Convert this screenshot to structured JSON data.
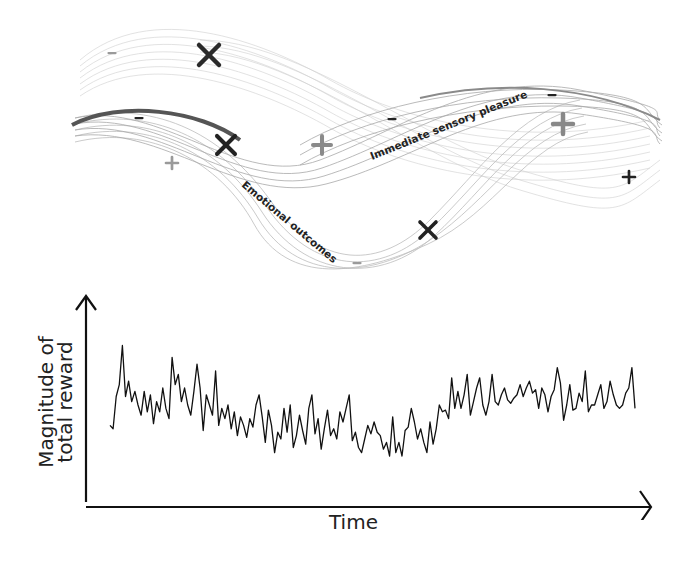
{
  "ribbons": {
    "labels": {
      "sensory": "Immediate sensory pleasure",
      "emotional": "Emotional outcomes"
    },
    "markers": [
      {
        "type": "x",
        "x": 209,
        "y": 55,
        "size": 10,
        "color": "#2a2a2a"
      },
      {
        "type": "minus",
        "x": 112,
        "y": 53,
        "size": 5,
        "color": "#9a9a9a"
      },
      {
        "type": "minus",
        "x": 139,
        "y": 118,
        "size": 5,
        "color": "#222222"
      },
      {
        "type": "x",
        "x": 226,
        "y": 145,
        "size": 9,
        "color": "#222222"
      },
      {
        "type": "plus",
        "x": 172,
        "y": 163,
        "size": 6,
        "color": "#9a9a9a"
      },
      {
        "type": "plus",
        "x": 322,
        "y": 145,
        "size": 9,
        "color": "#8a8a8a"
      },
      {
        "type": "minus",
        "x": 392,
        "y": 119,
        "size": 5,
        "color": "#222222"
      },
      {
        "type": "minus",
        "x": 552,
        "y": 95,
        "size": 5,
        "color": "#222222"
      },
      {
        "type": "plus",
        "x": 563,
        "y": 124,
        "size": 10,
        "color": "#888888"
      },
      {
        "type": "plus",
        "x": 629,
        "y": 177,
        "size": 6,
        "color": "#222222"
      },
      {
        "type": "x",
        "x": 428,
        "y": 230,
        "size": 8,
        "color": "#222222"
      },
      {
        "type": "minus",
        "x": 357,
        "y": 263,
        "size": 5,
        "color": "#9a9a9a"
      }
    ]
  },
  "chart_data": {
    "type": "line",
    "title": "",
    "xlabel": "Time",
    "ylabel_lines": [
      "Magnitude of",
      "total reward"
    ],
    "grid": false,
    "ticks": "none",
    "ylim": [
      0,
      1
    ],
    "values": [
      0.38,
      0.36,
      0.55,
      0.62,
      0.85,
      0.55,
      0.64,
      0.52,
      0.58,
      0.5,
      0.44,
      0.58,
      0.46,
      0.56,
      0.39,
      0.52,
      0.46,
      0.6,
      0.48,
      0.42,
      0.78,
      0.62,
      0.68,
      0.52,
      0.6,
      0.5,
      0.44,
      0.58,
      0.74,
      0.6,
      0.35,
      0.56,
      0.5,
      0.44,
      0.7,
      0.38,
      0.48,
      0.42,
      0.5,
      0.36,
      0.46,
      0.32,
      0.43,
      0.38,
      0.31,
      0.42,
      0.37,
      0.5,
      0.56,
      0.43,
      0.28,
      0.47,
      0.38,
      0.22,
      0.34,
      0.3,
      0.48,
      0.34,
      0.5,
      0.25,
      0.32,
      0.44,
      0.35,
      0.27,
      0.48,
      0.56,
      0.33,
      0.42,
      0.24,
      0.36,
      0.47,
      0.32,
      0.36,
      0.3,
      0.46,
      0.4,
      0.48,
      0.56,
      0.29,
      0.34,
      0.25,
      0.22,
      0.3,
      0.38,
      0.33,
      0.4,
      0.34,
      0.32,
      0.24,
      0.28,
      0.2,
      0.43,
      0.22,
      0.28,
      0.2,
      0.35,
      0.37,
      0.48,
      0.4,
      0.3,
      0.36,
      0.28,
      0.22,
      0.4,
      0.27,
      0.36,
      0.5,
      0.46,
      0.47,
      0.42,
      0.66,
      0.48,
      0.58,
      0.48,
      0.56,
      0.68,
      0.44,
      0.52,
      0.6,
      0.66,
      0.5,
      0.44,
      0.52,
      0.68,
      0.52,
      0.5,
      0.56,
      0.6,
      0.53,
      0.51,
      0.54,
      0.56,
      0.62,
      0.55,
      0.6,
      0.64,
      0.57,
      0.59,
      0.48,
      0.6,
      0.56,
      0.46,
      0.55,
      0.59,
      0.72,
      0.63,
      0.41,
      0.5,
      0.62,
      0.47,
      0.48,
      0.57,
      0.52,
      0.7,
      0.46,
      0.5,
      0.5,
      0.56,
      0.62,
      0.48,
      0.52,
      0.64,
      0.56,
      0.5,
      0.48,
      0.5,
      0.57,
      0.6,
      0.72,
      0.48
    ]
  }
}
